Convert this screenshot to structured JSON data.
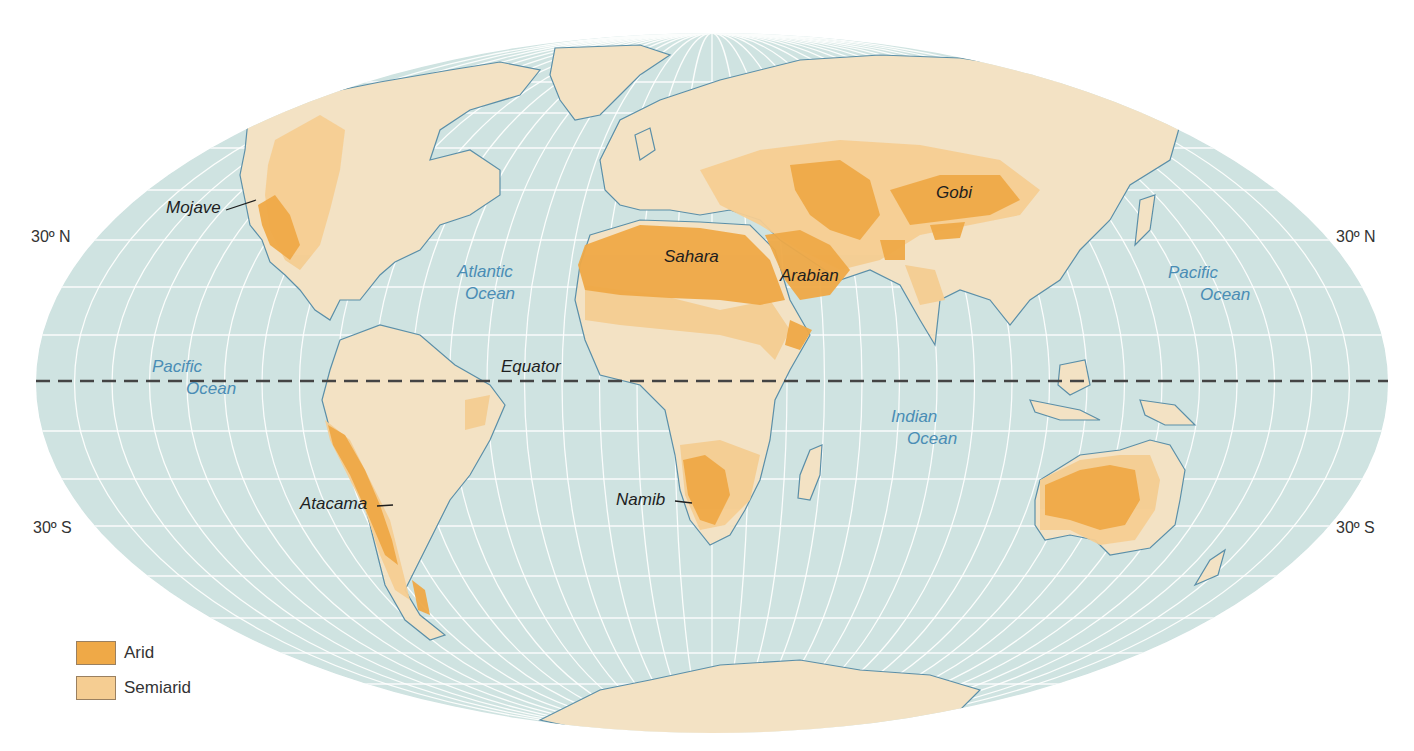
{
  "map": {
    "projection": "Mollweide",
    "colors": {
      "ocean": "#cfe3e1",
      "graticule": "#ffffff",
      "land": "#f3e2c4",
      "semiarid": "#f5cd92",
      "arid": "#efa947",
      "coastline": "#5b8fa8",
      "equator": "#444444",
      "ocean_label": "#4a8db5"
    },
    "latitude_labels": {
      "north_left": "30º N",
      "north_right": "30º N",
      "south_left": "30º S",
      "south_right": "30º S"
    },
    "equator_label": "Equator",
    "oceans": [
      {
        "line1": "Atlantic",
        "line2": "Ocean"
      },
      {
        "line1": "Pacific",
        "line2": "Ocean"
      },
      {
        "line1": "Pacific",
        "line2": "Ocean"
      },
      {
        "line1": "Indian",
        "line2": "Ocean"
      }
    ],
    "deserts": [
      {
        "name": "Mojave"
      },
      {
        "name": "Sahara"
      },
      {
        "name": "Arabian"
      },
      {
        "name": "Gobi"
      },
      {
        "name": "Atacama"
      },
      {
        "name": "Namib"
      }
    ]
  },
  "legend": {
    "items": [
      {
        "label": "Arid",
        "color": "#efa947"
      },
      {
        "label": "Semiarid",
        "color": "#f5cd92"
      }
    ]
  }
}
